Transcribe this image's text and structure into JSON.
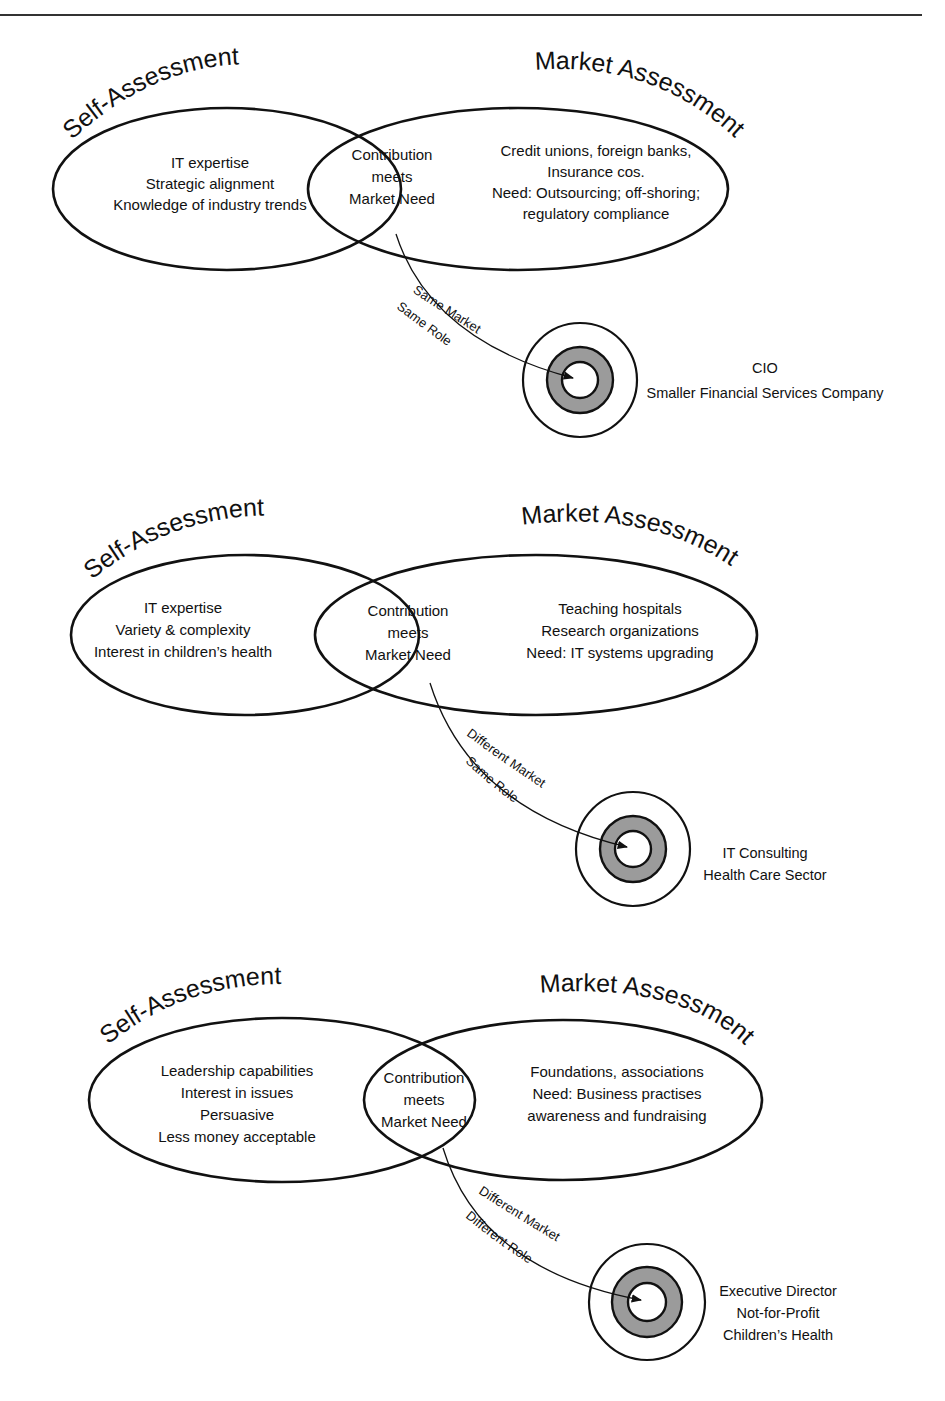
{
  "panels": [
    {
      "self_title": "Self-Assessment",
      "market_title": "Market Assessment",
      "self_items": [
        "IT expertise",
        "Strategic alignment",
        "Knowledge of industry trends"
      ],
      "overlap": [
        "Contribution",
        "meets",
        "Market Need"
      ],
      "market_items": [
        "Credit unions,  foreign banks,",
        "Insurance cos.",
        "Need: Outsourcing; off-shoring;",
        "regulatory compliance"
      ],
      "path_labels": [
        "Same Market",
        "Same Role"
      ],
      "destination": [
        "CIO",
        "Smaller Financial Services Company"
      ]
    },
    {
      "self_title": "Self-Assessment",
      "market_title": "Market Assessment",
      "self_items": [
        "IT expertise",
        "Variety & complexity",
        "Interest in children’s health"
      ],
      "overlap": [
        "Contribution",
        "meets",
        "Market Need"
      ],
      "market_items": [
        "Teaching hospitals",
        "Research organizations",
        "Need:  IT systems upgrading"
      ],
      "path_labels": [
        "Different Market",
        "Same Role"
      ],
      "destination": [
        "IT Consulting",
        "Health Care Sector"
      ]
    },
    {
      "self_title": "Self-Assessment",
      "market_title": "Market Assessment",
      "self_items": [
        "Leadership capabilities",
        "Interest in issues",
        "Persuasive",
        "Less money acceptable"
      ],
      "overlap": [
        "Contribution",
        "meets",
        "Market Need"
      ],
      "market_items": [
        "Foundations, associations",
        "Need:  Business practises",
        "awareness and fundraising"
      ],
      "path_labels": [
        "Different Market",
        "Different Role"
      ],
      "destination": [
        "Executive Director",
        "Not-for-Profit",
        "Children’s Health"
      ]
    }
  ],
  "colors": {
    "line": "#111111",
    "target_ring": "#9b9b9b",
    "background": "#ffffff"
  }
}
